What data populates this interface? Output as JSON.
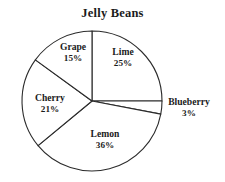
{
  "chart_data": {
    "type": "pie",
    "title": "Jelly Beans",
    "xlabel": "",
    "ylabel": "",
    "legend": "none",
    "grid": false,
    "value_unit": "percent",
    "start_angle_deg": 90,
    "direction": "clockwise",
    "categories": [
      "Lime",
      "Blueberry",
      "Lemon",
      "Cherry",
      "Grape"
    ],
    "values": [
      25,
      3,
      36,
      21,
      15
    ],
    "slices": [
      {
        "label": "Lime",
        "value": 25,
        "value_text": "25%",
        "label_position": "inside",
        "label_x": 123,
        "label_y": 58,
        "color": "#ffffff"
      },
      {
        "label": "Blueberry",
        "value": 3,
        "value_text": "3%",
        "label_position": "outside-right",
        "label_x": 189,
        "label_y": 108,
        "color": "#ffffff"
      },
      {
        "label": "Lemon",
        "value": 36,
        "value_text": "36%",
        "label_position": "inside",
        "label_x": 105,
        "label_y": 140,
        "color": "#ffffff"
      },
      {
        "label": "Cherry",
        "value": 21,
        "value_text": "21%",
        "label_position": "inside",
        "label_x": 50,
        "label_y": 104,
        "color": "#ffffff"
      },
      {
        "label": "Grape",
        "value": 15,
        "value_text": "15%",
        "label_position": "inside",
        "label_x": 73,
        "label_y": 53,
        "color": "#ffffff"
      }
    ],
    "geometry": {
      "center_x": 92,
      "center_y": 101,
      "radius": 70
    },
    "style": {
      "background": "#ffffff",
      "stroke": "#2b2b2b",
      "fill": "#ffffff",
      "text": "#1b1b1b"
    }
  }
}
